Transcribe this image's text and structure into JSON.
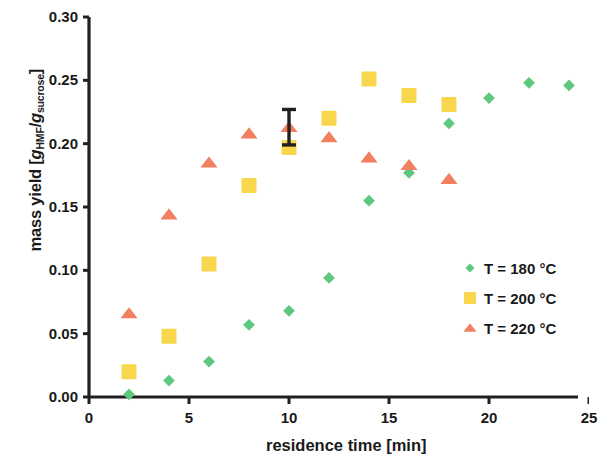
{
  "chart_data": {
    "type": "scatter",
    "title": "",
    "xlabel": "residence time [min]",
    "ylabel": "mass yield [gHMF/gsucrose]",
    "ylabel_parts": {
      "main": "mass yield  [",
      "g1": "g",
      "sub1": "HMF",
      "slash": "/",
      "g2": "g",
      "sub2": "sucrose",
      "close": "]"
    },
    "xlim": [
      0,
      25
    ],
    "ylim": [
      0.0,
      0.3
    ],
    "xticks": [
      0,
      5,
      10,
      15,
      20,
      25
    ],
    "xtick_labels": [
      "0",
      "5",
      "10",
      "15",
      "20",
      "25"
    ],
    "yticks": [
      0.0,
      0.05,
      0.1,
      0.15,
      0.2,
      0.25,
      0.3
    ],
    "ytick_labels": [
      "0.00",
      "0.05",
      "0.10",
      "0.15",
      "0.20",
      "0.25",
      "0.30"
    ],
    "grid": false,
    "legend_position": "right-middle",
    "series": [
      {
        "name": "T = 180 °C",
        "marker": "diamond",
        "color": "#5FC87F",
        "x": [
          2,
          4,
          6,
          8,
          10,
          12,
          14,
          16,
          18,
          20,
          22,
          24
        ],
        "y": [
          0.002,
          0.013,
          0.028,
          0.057,
          0.068,
          0.094,
          0.155,
          0.177,
          0.216,
          0.236,
          0.248,
          0.246
        ]
      },
      {
        "name": "T = 200 °C",
        "marker": "square",
        "color": "#F8D74E",
        "x": [
          2,
          4,
          6,
          8,
          10,
          12,
          14,
          16,
          18
        ],
        "y": [
          0.02,
          0.048,
          0.105,
          0.167,
          0.197,
          0.22,
          0.251,
          0.238,
          0.231
        ]
      },
      {
        "name": "T = 220 °C",
        "marker": "triangle",
        "color": "#F0805F",
        "x": [
          2,
          4,
          6,
          8,
          10,
          12,
          14,
          16,
          18
        ],
        "y": [
          0.066,
          0.144,
          0.185,
          0.208,
          0.213,
          0.205,
          0.189,
          0.183,
          0.172
        ],
        "error_bars": [
          {
            "x": 10,
            "y": 0.213,
            "yerr": 0.014
          }
        ]
      }
    ],
    "legend_entries": [
      {
        "label": "T = 180 °C",
        "marker": "diamond",
        "color": "#5FC87F"
      },
      {
        "label": "T = 200 °C",
        "marker": "square",
        "color": "#F8D74E"
      },
      {
        "label": "T = 220 °C",
        "marker": "triangle",
        "color": "#F0805F"
      }
    ],
    "axis_color": "#231f20"
  }
}
